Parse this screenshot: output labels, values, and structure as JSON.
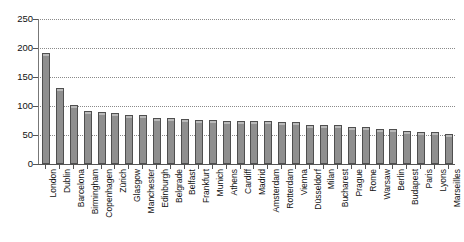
{
  "chart_data": {
    "type": "bar",
    "title": "",
    "subtitle": "",
    "xlabel": "",
    "ylabel": "",
    "ylim": [
      0,
      250
    ],
    "yticks": [
      0,
      50,
      100,
      150,
      200,
      250
    ],
    "ytick_labels": [
      "0",
      "50",
      "100",
      "150",
      "200",
      "250"
    ],
    "grid": true,
    "grid_style": "dotted horizontal",
    "legend": null,
    "legend_position": "none",
    "orientation": "vertical",
    "bar_color": "#8f8f8f",
    "bar_border_color": "#4f4f4f",
    "categories": [
      "London",
      "Dublin",
      "Barcelona",
      "Birmingham",
      "Copenhagen",
      "Zürich",
      "Glasgow",
      "Manchester",
      "Edinburgh",
      "Belgrade",
      "Belfast",
      "Frankfurt",
      "Munich",
      "Athens",
      "Cardiff",
      "Madrid",
      "Amsterdam",
      "Rotterdam",
      "Vienna",
      "Düsseldorf",
      "Milan",
      "Bucharest",
      "Prague",
      "Rome",
      "Warsaw",
      "Berlin",
      "Budapest",
      "Paris",
      "Lyons",
      "Marseilles"
    ],
    "values": [
      192,
      131,
      101,
      91,
      90,
      88,
      84,
      84,
      80,
      80,
      77,
      76,
      76,
      75,
      75,
      75,
      74,
      73,
      72,
      68,
      67,
      67,
      64,
      64,
      61,
      60,
      57,
      56,
      56,
      52
    ]
  }
}
